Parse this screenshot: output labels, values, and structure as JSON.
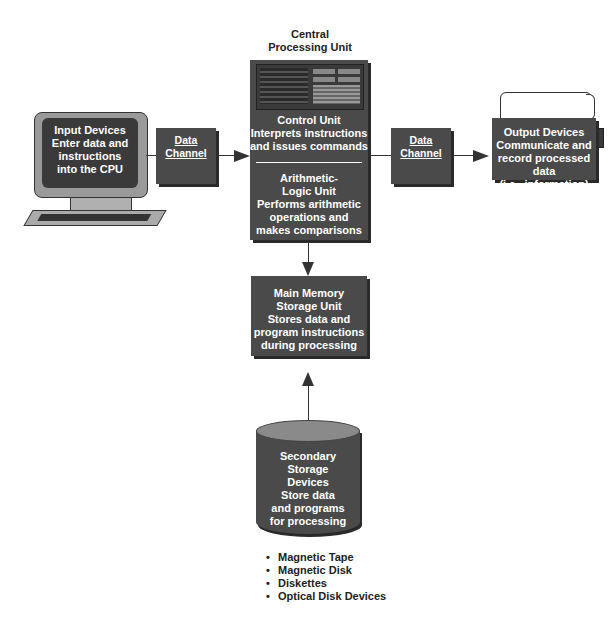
{
  "cpu": {
    "title_line1": "Central",
    "title_line2": "Processing Unit",
    "control_unit": [
      "Control Unit",
      "Interprets instructions",
      "and issues commands"
    ],
    "alu": [
      "Arithmetic-",
      "Logic Unit",
      "Performs arithmetic",
      "operations and",
      "makes comparisons"
    ]
  },
  "input": [
    "Input Devices",
    "Enter data and",
    "instructions",
    "into the CPU"
  ],
  "channel_left": {
    "label": "Data Channel"
  },
  "channel_right": {
    "label": "Data Channel"
  },
  "output": [
    "Output Devices",
    "Communicate and",
    "record processed data",
    "(i.e., information)"
  ],
  "memory": [
    "Main Memory",
    "Storage Unit",
    "Stores data and",
    "program instructions",
    "during processing"
  ],
  "secondary": [
    "Secondary",
    "Storage",
    "Devices",
    "Store data",
    "and programs",
    "for processing"
  ],
  "secondary_examples": [
    "Magnetic Tape",
    "Magnetic Disk",
    "Diskettes",
    "Optical Disk Devices"
  ],
  "colors": {
    "box": "#4a4a4a",
    "shadow": "#2a2a2a",
    "line": "#333333",
    "monitor_bezel": "#9a9a9a"
  }
}
